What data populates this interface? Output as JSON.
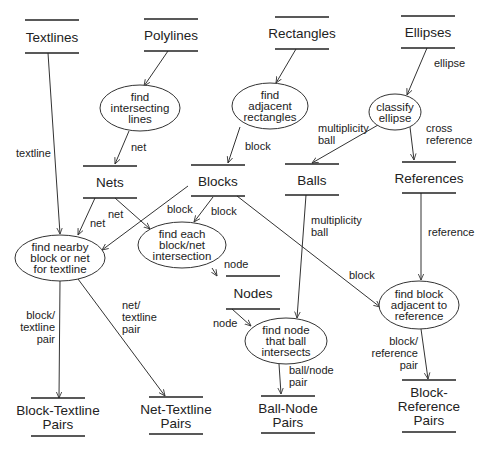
{
  "diagram": {
    "type": "data-flow",
    "stores": [
      {
        "id": "textlines",
        "lines": [
          "Textlines"
        ],
        "x": 52,
        "y1": 20,
        "y2": 53
      },
      {
        "id": "polylines",
        "lines": [
          "Polylines"
        ],
        "x": 171,
        "y1": 19,
        "y2": 51
      },
      {
        "id": "rectangles",
        "lines": [
          "Rectangles"
        ],
        "x": 302,
        "y1": 17,
        "y2": 49
      },
      {
        "id": "ellipses",
        "lines": [
          "Ellipses"
        ],
        "x": 428,
        "y1": 16,
        "y2": 48
      },
      {
        "id": "nets",
        "lines": [
          "Nets"
        ],
        "x": 110,
        "y1": 166,
        "y2": 198
      },
      {
        "id": "blocks",
        "lines": [
          "Blocks"
        ],
        "x": 218,
        "y1": 165,
        "y2": 196
      },
      {
        "id": "balls",
        "lines": [
          "Balls"
        ],
        "x": 312,
        "y1": 164,
        "y2": 195
      },
      {
        "id": "references",
        "lines": [
          "References"
        ],
        "x": 429,
        "y1": 162,
        "y2": 193
      },
      {
        "id": "nodes",
        "lines": [
          "Nodes"
        ],
        "x": 253,
        "y1": 276,
        "y2": 309
      },
      {
        "id": "block-textline-pairs",
        "lines": [
          "Block-Textline",
          "Pairs"
        ],
        "x": 58,
        "y1": 398,
        "y2": 436
      },
      {
        "id": "net-textline-pairs",
        "lines": [
          "Net-Textline",
          "Pairs"
        ],
        "x": 176,
        "y1": 397,
        "y2": 434
      },
      {
        "id": "ball-node-pairs",
        "lines": [
          "Ball-Node",
          "Pairs"
        ],
        "x": 288,
        "y1": 396,
        "y2": 433
      },
      {
        "id": "block-reference-pairs",
        "lines": [
          "Block-",
          "Reference",
          "Pairs"
        ],
        "x": 429,
        "y1": 380,
        "y2": 432
      }
    ],
    "processes": [
      {
        "id": "find-intersecting-lines",
        "lines": [
          "find",
          "intersecting",
          "lines"
        ],
        "cx": 140,
        "cy": 108,
        "rx": 40,
        "ry": 23
      },
      {
        "id": "find-adjacent-rectangles",
        "lines": [
          "find",
          "adjacent",
          "rectangles"
        ],
        "cx": 270,
        "cy": 106,
        "rx": 38,
        "ry": 23
      },
      {
        "id": "classify-ellipse",
        "lines": [
          "classify",
          "ellipse"
        ],
        "cx": 395,
        "cy": 112,
        "rx": 26,
        "ry": 18
      },
      {
        "id": "find-nearby-block-or-net",
        "lines": [
          "find nearby",
          "block or net",
          "for textline"
        ],
        "cx": 60,
        "cy": 258,
        "rx": 45,
        "ry": 23
      },
      {
        "id": "find-block-net-intersection",
        "lines": [
          "find each",
          "block/net",
          "intersection"
        ],
        "cx": 182,
        "cy": 245,
        "rx": 44,
        "ry": 23
      },
      {
        "id": "find-node-ball-intersects",
        "lines": [
          "find node",
          "that ball",
          "intersects"
        ],
        "cx": 286,
        "cy": 341,
        "rx": 41,
        "ry": 23
      },
      {
        "id": "find-block-adjacent-reference",
        "lines": [
          "find block",
          "adjacent to",
          "reference"
        ],
        "cx": 419,
        "cy": 305,
        "rx": 40,
        "ry": 24
      }
    ],
    "flows": [
      {
        "from": "textlines",
        "to": "find-nearby-block-or-net",
        "label": [
          "textline"
        ],
        "lx": 16,
        "ly": 157
      },
      {
        "from": "polylines",
        "to": "find-intersecting-lines",
        "label": [],
        "lx": 0,
        "ly": 0
      },
      {
        "from": "find-intersecting-lines",
        "to": "nets",
        "label": [
          "net"
        ],
        "lx": 131,
        "ly": 151
      },
      {
        "from": "rectangles",
        "to": "find-adjacent-rectangles",
        "label": [],
        "lx": 0,
        "ly": 0
      },
      {
        "from": "find-adjacent-rectangles",
        "to": "blocks",
        "label": [
          "block"
        ],
        "lx": 245,
        "ly": 150
      },
      {
        "from": "ellipses",
        "to": "classify-ellipse",
        "label": [
          "ellipse"
        ],
        "lx": 434,
        "ly": 67
      },
      {
        "from": "classify-ellipse",
        "to": "balls",
        "label": [
          "multiplicity",
          "ball"
        ],
        "lx": 318,
        "ly": 132
      },
      {
        "from": "classify-ellipse",
        "to": "references",
        "label": [
          "cross",
          "reference"
        ],
        "lx": 426,
        "ly": 132
      },
      {
        "from": "nets",
        "to": "find-nearby-block-or-net",
        "label": [
          "net"
        ],
        "lx": 90,
        "ly": 227
      },
      {
        "from": "nets",
        "to": "find-block-net-intersection",
        "label": [
          "net"
        ],
        "lx": 108,
        "ly": 218
      },
      {
        "from": "blocks",
        "to": "find-nearby-block-or-net",
        "label": [
          "block"
        ],
        "lx": 167,
        "ly": 213
      },
      {
        "from": "blocks",
        "to": "find-block-net-intersection",
        "label": [
          "block"
        ],
        "lx": 211,
        "ly": 215
      },
      {
        "from": "blocks",
        "to": "find-block-adjacent-reference",
        "label": [
          "block"
        ],
        "lx": 349,
        "ly": 279
      },
      {
        "from": "find-block-net-intersection",
        "to": "nodes",
        "label": [
          "node"
        ],
        "lx": 224,
        "ly": 268
      },
      {
        "from": "balls",
        "to": "find-node-ball-intersects",
        "label": [
          "multiplicity",
          "ball"
        ],
        "lx": 311,
        "ly": 224
      },
      {
        "from": "references",
        "to": "find-block-adjacent-reference",
        "label": [
          "reference"
        ],
        "lx": 428,
        "ly": 236
      },
      {
        "from": "nodes",
        "to": "find-node-ball-intersects",
        "label": [
          "node"
        ],
        "lx": 213,
        "ly": 327
      },
      {
        "from": "find-nearby-block-or-net",
        "to": "block-textline-pairs",
        "label": [
          "block/",
          "textline",
          "pair"
        ],
        "lx": 23,
        "ly": 319,
        "anchor": "end",
        "ax": 55
      },
      {
        "from": "find-nearby-block-or-net",
        "to": "net-textline-pairs",
        "label": [
          "net/",
          "textline",
          "pair"
        ],
        "lx": 122,
        "ly": 309
      },
      {
        "from": "find-node-ball-intersects",
        "to": "ball-node-pairs",
        "label": [
          "ball/node",
          "pair"
        ],
        "lx": 289,
        "ly": 374
      },
      {
        "from": "find-block-adjacent-reference",
        "to": "block-reference-pairs",
        "label": [
          "block/",
          "reference",
          "pair"
        ],
        "lx": 417,
        "ly": 345,
        "anchor": "end",
        "ax": 418
      }
    ]
  }
}
